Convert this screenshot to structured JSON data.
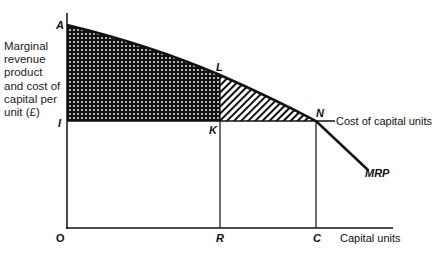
{
  "diagram": {
    "y_axis_label": "Marginal revenue product and cost of capital per unit (£)",
    "x_axis_label": "Capital units",
    "cost_line_label": "Cost of capital units",
    "curve_label": "MRP",
    "points": {
      "A": "A",
      "I": "I",
      "L": "L",
      "K": "K",
      "N": "N",
      "O": "O",
      "R": "R",
      "C": "C"
    },
    "regions": [
      {
        "name": "AIKL",
        "fill": "dotted-dark"
      },
      {
        "name": "LKN",
        "fill": "hatched"
      }
    ]
  }
}
